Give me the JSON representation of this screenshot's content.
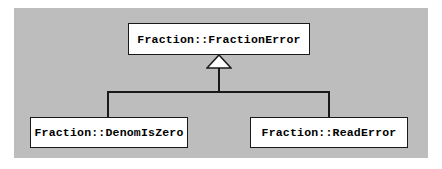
{
  "diagram": {
    "type": "uml-class-inheritance",
    "canvas": {
      "background_color": "#bdbdbd",
      "page_background_color": "#ffffff"
    },
    "style": {
      "box_fill": "#ffffff",
      "box_border_color": "#1a1a1a",
      "line_color": "#1a1a1a",
      "text_color": "#000000"
    },
    "base_class": {
      "label": "Fraction::FractionError"
    },
    "derived_classes": [
      {
        "label": "Fraction::DenomIsZero"
      },
      {
        "label": "Fraction::ReadError"
      }
    ],
    "relationship": {
      "kind": "generalization",
      "arrow": "hollow-triangle",
      "points_to": "Fraction::FractionError"
    }
  }
}
